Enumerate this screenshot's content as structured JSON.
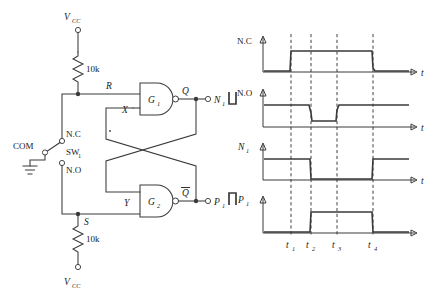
{
  "figure": {
    "kind": "switch-debounce-sr-latch-with-timing-diagram"
  },
  "circuit": {
    "supply_top_label": "V",
    "supply_top_sub": "CC",
    "supply_bottom_label": "V",
    "supply_bottom_sub": "CC",
    "resistor_top_value": "10k",
    "resistor_bottom_value": "10k",
    "node_R": "R",
    "node_S": "S",
    "node_X": "X",
    "node_Y": "Y",
    "node_Q": "Q",
    "node_Qbar": "Q",
    "gate1_label": "G",
    "gate1_sub": "1",
    "gate2_label": "G",
    "gate2_sub": "2",
    "out_n1_label": "N",
    "out_n1_sub": "1",
    "out_p1_label": "P",
    "out_p1_sub": "1",
    "switch_common": "COM",
    "switch_nc": "N.C",
    "switch_no": "N.O",
    "switch_name": "SW",
    "switch_name_sub": "1",
    "switch_position": "N.C"
  },
  "timing": {
    "time_axis_label": "t",
    "tick_labels": [
      "t",
      "t",
      "t",
      "t"
    ],
    "tick_subs": [
      "1",
      "2",
      "3",
      "4"
    ],
    "tick_x": [
      290,
      311,
      337,
      373
    ],
    "rows": [
      {
        "name": "N.C",
        "sub": "",
        "axis_tick_label": "t",
        "segments": [
          [
            260,
            0
          ],
          [
            291,
            1
          ],
          [
            293,
            1
          ],
          [
            371,
            0
          ],
          [
            375,
            0
          ],
          [
            420,
            0
          ]
        ],
        "description": "low until t1, bounce then high, falls at t4"
      },
      {
        "name": "N.O",
        "sub": "",
        "axis_tick_label": "t",
        "segments": [
          [
            260,
            1
          ],
          [
            309,
            1
          ],
          [
            312,
            0
          ],
          [
            335,
            0
          ],
          [
            338,
            1
          ],
          [
            420,
            1
          ]
        ],
        "description": "high until t2, low between t2 and t3, high after"
      },
      {
        "name": "N",
        "sub": "1",
        "axis_tick_label": "t",
        "segments": [
          [
            260,
            1
          ],
          [
            310,
            1
          ],
          [
            312,
            0
          ],
          [
            372,
            0
          ],
          [
            374,
            1
          ],
          [
            420,
            1
          ]
        ],
        "description": "high until t2, low t2-t4, high after t4"
      },
      {
        "name": "P",
        "sub": "1",
        "axis_tick_label": "",
        "segments": [
          [
            260,
            0
          ],
          [
            310,
            0
          ],
          [
            312,
            1
          ],
          [
            372,
            1
          ],
          [
            374,
            0
          ],
          [
            420,
            0
          ]
        ],
        "description": "low until t2, high t2-t4, low after t4"
      }
    ]
  },
  "colors": {
    "line": "#3a3a3a",
    "text": "#1a1a1a",
    "background": "#ffffff",
    "dash": "#2a2a2a"
  }
}
